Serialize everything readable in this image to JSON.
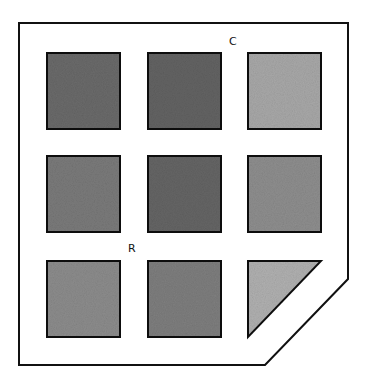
{
  "diagram": {
    "labels": {
      "column": "C",
      "row": "R"
    },
    "grid": {
      "rows": 3,
      "cols": 3
    },
    "cells": [
      {
        "row": 1,
        "col": 1,
        "shade": "#6a6a6a",
        "shape": "square"
      },
      {
        "row": 1,
        "col": 2,
        "shade": "#636363",
        "shape": "square"
      },
      {
        "row": 1,
        "col": 3,
        "shade": "#a8a8a8",
        "shape": "square"
      },
      {
        "row": 2,
        "col": 1,
        "shade": "#7a7a7a",
        "shape": "square"
      },
      {
        "row": 2,
        "col": 2,
        "shade": "#656565",
        "shape": "square"
      },
      {
        "row": 2,
        "col": 3,
        "shade": "#8e8e8e",
        "shape": "square"
      },
      {
        "row": 3,
        "col": 1,
        "shade": "#8c8c8c",
        "shape": "square"
      },
      {
        "row": 3,
        "col": 2,
        "shade": "#7e7e7e",
        "shape": "square"
      },
      {
        "row": 3,
        "col": 3,
        "shade": "#b0b0b0",
        "shape": "triangle"
      }
    ]
  }
}
